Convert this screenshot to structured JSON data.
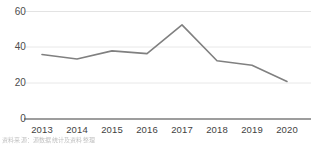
{
  "chart_data": {
    "type": "line",
    "title": "",
    "subtitle": "",
    "xlabel": "",
    "ylabel": "",
    "categories": [
      "2013",
      "2014",
      "2015",
      "2016",
      "2017",
      "2018",
      "2019",
      "2020"
    ],
    "x": [
      2013,
      2014,
      2015,
      2016,
      2017,
      2018,
      2019,
      2020
    ],
    "values": [
      36,
      33.5,
      38,
      36.5,
      52.5,
      32.5,
      30,
      21
    ],
    "series": [
      {
        "name": "series-1",
        "values": [
          36,
          33.5,
          38,
          36.5,
          52.5,
          32.5,
          30,
          21
        ],
        "color": "#808080"
      }
    ],
    "ylim": [
      0,
      60
    ],
    "yticks": [
      0,
      20,
      40,
      60
    ],
    "ytick_labels": [
      "0",
      "20",
      "40",
      "60"
    ],
    "grid": true,
    "grid_axis": "y",
    "legend": false,
    "legend_position": "none",
    "markers": false,
    "line_width": 1.6
  },
  "axes": {
    "y_labels": [
      "60",
      "40",
      "20",
      "0"
    ],
    "x_labels": [
      "2013",
      "2014",
      "2015",
      "2016",
      "2017",
      "2018",
      "2019",
      "2020"
    ]
  },
  "caption": {
    "text": "资料来源：源数据统计及资料整理"
  },
  "colors": {
    "line": "#808080",
    "gridline": "#e3e3e3",
    "axis": "#808080",
    "tick_text": "#4d4d4d",
    "background": "#ffffff"
  }
}
